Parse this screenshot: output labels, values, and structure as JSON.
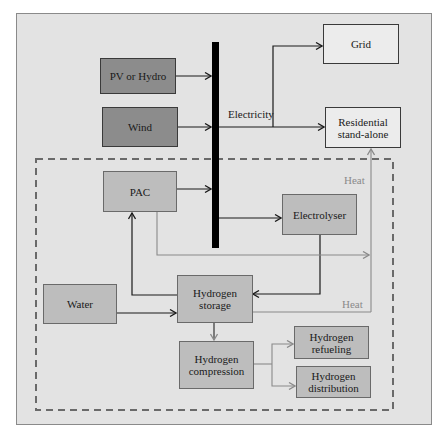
{
  "diagram": {
    "nodes": {
      "pv_hydro": {
        "label": "PV or Hydro",
        "fill": "#8c8c8c"
      },
      "wind": {
        "label": "Wind",
        "fill": "#8c8c8c"
      },
      "grid": {
        "label": "Grid",
        "fill": "#ececec"
      },
      "residential": {
        "label": "Residential stand-alone",
        "line1": "Residential",
        "line2": "stand-alone",
        "fill": "#ececec"
      },
      "pac": {
        "label": "PAC",
        "fill": "#bdbdbd"
      },
      "electrolyser": {
        "label": "Electrolyser",
        "fill": "#bdbdbd"
      },
      "water": {
        "label": "Water",
        "fill": "#bdbdbd"
      },
      "hydrogen_storage": {
        "label": "Hydrogen storage",
        "line1": "Hydrogen",
        "line2": "storage",
        "fill": "#bdbdbd"
      },
      "hydrogen_compression": {
        "label": "Hydrogen compression",
        "line1": "Hydrogen",
        "line2": "compression",
        "fill": "#bdbdbd"
      },
      "hydrogen_refueling": {
        "label": "Hydrogen refueling",
        "line1": "Hydrogen",
        "line2": "refueling",
        "fill": "#bdbdbd"
      },
      "hydrogen_distribution": {
        "label": "Hydrogen distribution",
        "line1": "Hydrogen",
        "line2": "distribution",
        "fill": "#bdbdbd"
      }
    },
    "edge_labels": {
      "electricity": "Electricity",
      "heat_top": "Heat",
      "heat_bottom": "Heat"
    },
    "edges": [
      {
        "from": "PV or Hydro",
        "to": "Electricity bus"
      },
      {
        "from": "Wind",
        "to": "Electricity bus"
      },
      {
        "from": "Electricity bus",
        "to": "Grid",
        "label": "Electricity"
      },
      {
        "from": "Electricity bus",
        "to": "Residential stand-alone",
        "label": "Electricity"
      },
      {
        "from": "PAC",
        "to": "Electricity bus"
      },
      {
        "from": "Electricity bus",
        "to": "Electrolyser"
      },
      {
        "from": "Electrolyser",
        "to": "Hydrogen storage"
      },
      {
        "from": "Hydrogen storage",
        "to": "PAC"
      },
      {
        "from": "Water",
        "to": "Hydrogen storage"
      },
      {
        "from": "PAC",
        "to": "Residential stand-alone",
        "label": "Heat"
      },
      {
        "from": "Hydrogen storage",
        "to": "Residential stand-alone",
        "label": "Heat"
      },
      {
        "from": "Hydrogen storage",
        "to": "Hydrogen compression"
      },
      {
        "from": "Hydrogen compression",
        "to": "Hydrogen refueling"
      },
      {
        "from": "Hydrogen compression",
        "to": "Hydrogen distribution"
      }
    ],
    "colors": {
      "background": "#e3e3e3",
      "bus": "#000000",
      "electric_line": "#1a1a1a",
      "heat_line": "#8a8a8a",
      "dashed_boundary": "#6a6a6a"
    }
  }
}
